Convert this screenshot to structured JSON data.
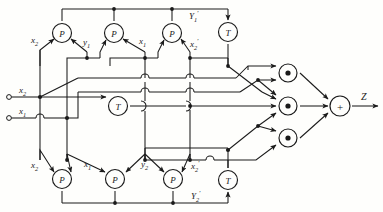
{
  "diagram": {
    "output_label": "Z",
    "colors": {
      "wire": "#1a1a1a",
      "background": "#fefefc",
      "gate_fill": "#fefefc"
    },
    "inputs": [
      {
        "name": "input-x2",
        "label": "x",
        "sub": "2",
        "x": 20,
        "y": 97
      },
      {
        "name": "input-x1",
        "label": "x",
        "sub": "1",
        "x": 20,
        "y": 118
      }
    ],
    "gates": [
      {
        "id": "p-top-1",
        "type": "P",
        "symbol": "P",
        "cx": 62,
        "cy": 33
      },
      {
        "id": "p-top-2",
        "type": "P",
        "symbol": "P",
        "cx": 114,
        "cy": 33
      },
      {
        "id": "p-top-3",
        "type": "P",
        "symbol": "P",
        "cx": 172,
        "cy": 33
      },
      {
        "id": "t-top",
        "type": "T",
        "symbol": "T",
        "cx": 228,
        "cy": 32
      },
      {
        "id": "t-middle",
        "type": "T",
        "symbol": "T",
        "cx": 118,
        "cy": 106
      },
      {
        "id": "p-bottom-1",
        "type": "P",
        "symbol": "P",
        "cx": 62,
        "cy": 179
      },
      {
        "id": "p-bottom-2",
        "type": "P",
        "symbol": "P",
        "cx": 115,
        "cy": 179
      },
      {
        "id": "p-bottom-3",
        "type": "P",
        "symbol": "P",
        "cx": 173,
        "cy": 179
      },
      {
        "id": "t-bottom",
        "type": "T",
        "symbol": "T",
        "cx": 228,
        "cy": 180
      },
      {
        "id": "and-1",
        "type": "AND",
        "symbol": "dot",
        "cx": 288,
        "cy": 73
      },
      {
        "id": "and-2",
        "type": "AND",
        "symbol": "dot",
        "cx": 288,
        "cy": 106
      },
      {
        "id": "and-3",
        "type": "AND",
        "symbol": "dot",
        "cx": 288,
        "cy": 138
      },
      {
        "id": "sum",
        "type": "SUM",
        "symbol": "+",
        "cx": 340,
        "cy": 106
      }
    ],
    "signal_labels": [
      {
        "id": "lbl-x2-top",
        "text": "x",
        "sub": "2",
        "sup": "",
        "x": 31,
        "y": 36
      },
      {
        "id": "lbl-y1",
        "text": "y",
        "sub": "1",
        "sup": "",
        "x": 83,
        "y": 38
      },
      {
        "id": "lbl-x1-top",
        "text": "x",
        "sub": "1",
        "sup": "",
        "x": 139,
        "y": 37
      },
      {
        "id": "lbl-x2p-top",
        "text": "x",
        "sub": "2",
        "sup": "′",
        "x": 190,
        "y": 38
      },
      {
        "id": "lbl-Y1p",
        "text": "Y",
        "sub": "1",
        "sup": "′",
        "x": 189,
        "y": 10
      },
      {
        "id": "lbl-x2-bot",
        "text": "x",
        "sub": "2",
        "sup": "",
        "x": 31,
        "y": 161
      },
      {
        "id": "lbl-x1-bot",
        "text": "x",
        "sub": "1",
        "sup": "",
        "x": 84,
        "y": 160
      },
      {
        "id": "lbl-y2",
        "text": "y",
        "sub": "2",
        "sup": "",
        "x": 141,
        "y": 160
      },
      {
        "id": "lbl-x2p-bot",
        "text": "x",
        "sub": "2",
        "sup": "′",
        "x": 191,
        "y": 160
      },
      {
        "id": "lbl-Y2p",
        "text": "Y",
        "sub": "2",
        "sup": "′",
        "x": 191,
        "y": 190
      },
      {
        "id": "lbl-x2-in",
        "text": "x",
        "sub": "2",
        "sup": "",
        "x": 19,
        "y": 86
      },
      {
        "id": "lbl-x1-in",
        "text": "x",
        "sub": "1",
        "sup": "",
        "x": 19,
        "y": 107
      },
      {
        "id": "lbl-Z-out",
        "text": "Z",
        "sub": "",
        "sup": "",
        "x": 361,
        "y": 92
      }
    ]
  }
}
